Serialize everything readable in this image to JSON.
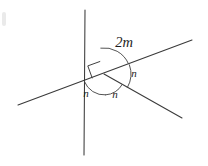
{
  "figure": {
    "type": "geometry-diagram",
    "canvas": {
      "width": 208,
      "height": 166,
      "background": "#ffffff"
    },
    "vertex": {
      "x": 104,
      "y": 74,
      "label": "intersection-point"
    },
    "stroke_color": "#3a3a3a",
    "text_color": "#1d1d1d",
    "lines": [
      {
        "name": "line-shallow-diagonal",
        "description": "near-horizontal line rising to the right",
        "x1": 18,
        "y1": 105,
        "x2": 192,
        "y2": 40
      },
      {
        "name": "line-steep-vertical",
        "description": "steep near-vertical line",
        "x1": 85,
        "y1": 10,
        "x2": 84,
        "y2": 155
      },
      {
        "name": "ray-lower-right",
        "description": "ray from vertex toward lower right",
        "x1": 104,
        "y1": 74,
        "x2": 182,
        "y2": 118
      }
    ],
    "right_angle": {
      "name": "right-angle-mark",
      "description": "square marker between the steep line upper arm and the shallow line left arm",
      "size": 13
    },
    "angles": [
      {
        "name": "angle-2m",
        "label": "2m",
        "position": {
          "x": 124,
          "y": 44
        },
        "arc_radius": 26,
        "start_deg": 97,
        "end_deg": 20,
        "description": "large arc spanning from steep upper arm to shallow right arm"
      },
      {
        "name": "angle-n-right",
        "label": "n",
        "position": {
          "x": 134,
          "y": 74
        },
        "arc_radius": 27,
        "start_deg": 20,
        "end_deg": -30,
        "description": "arc between shallow right arm and lower-right ray"
      },
      {
        "name": "angle-n-bottom-right",
        "label": "n",
        "position": {
          "x": 115,
          "y": 95
        },
        "arc_radius": 21,
        "start_deg": -30,
        "end_deg": -86,
        "description": "arc between lower-right ray and steep lower arm"
      },
      {
        "name": "angle-n-bottom-left",
        "label": "n",
        "position": {
          "x": 86,
          "y": 94
        },
        "arc_radius": 21,
        "start_deg": -86,
        "end_deg": -159,
        "description": "arc between steep lower arm and shallow left arm"
      }
    ],
    "edge_artifact": {
      "name": "left-edge-smudge",
      "x": 2,
      "y": 12,
      "width": 4,
      "height": 14
    }
  }
}
